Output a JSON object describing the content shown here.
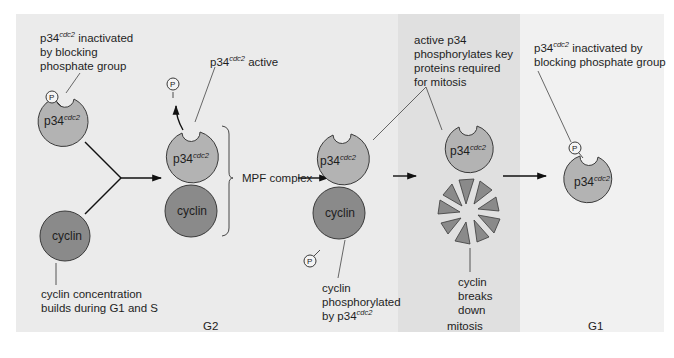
{
  "colors": {
    "panel_g2": "#ebebeb",
    "panel_mitosis": "#e0e0e0",
    "panel_g1": "#f1f1f1",
    "p34_fill": "#b3b3b3",
    "cyclin_fill": "#8a8a8a",
    "outline": "#3a3a3a",
    "phosphate_fill": "#f4f4f4"
  },
  "phases": {
    "g2": "G2",
    "mitosis": "mitosis",
    "g1": "G1"
  },
  "molecules": {
    "p34_base": "p34",
    "p34_sup": "cdc2",
    "cyclin": "cyclin",
    "phosphate": "P"
  },
  "annotations": {
    "p34_inactive_left": {
      "base": "p34",
      "sup": "cdc2",
      "lines": [
        " inactivated",
        "by blocking",
        "phosphate group"
      ]
    },
    "p34_active": {
      "base": "p34",
      "sup": "cdc2",
      "text": " active"
    },
    "cyclin_builds": {
      "lines": [
        "cyclin concentration",
        "builds during G1 and S"
      ]
    },
    "mpf_complex": "MPF complex",
    "active_p34_phosphorylates": {
      "lines": [
        "active p34",
        "phosphorylates key",
        "proteins required",
        "for mitosis"
      ]
    },
    "cyclin_phosphorylated": {
      "lines": [
        "cyclin",
        "phosphorylated"
      ],
      "last_base": "by p34",
      "last_sup": "cdc2"
    },
    "cyclin_breaks_down": {
      "lines": [
        "cyclin",
        "breaks",
        "down"
      ]
    },
    "p34_inactive_right": {
      "base": "p34",
      "sup": "cdc2",
      "line1_rest": " inactivated by",
      "line2": "blocking phosphate group"
    }
  }
}
